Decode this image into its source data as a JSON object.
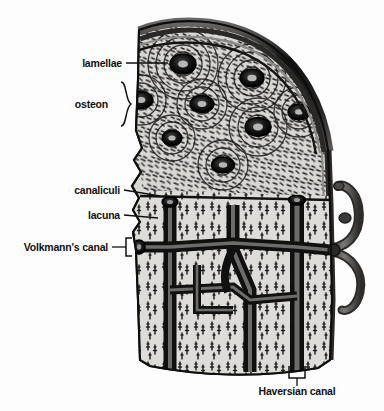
{
  "figure": {
    "background_color": "#fdfdfd",
    "ink_color": "#111111",
    "bone_fill_color": "#d8d6d2",
    "canal_color": "#1a1a1a",
    "vessel_color": "#5a5856",
    "width": 384,
    "height": 411
  },
  "labels": [
    {
      "id": "lamellae",
      "text": "lamellae",
      "align": "right",
      "text_left": 30,
      "text_top": 58,
      "text_width": 92,
      "connector": "line"
    },
    {
      "id": "osteon",
      "text": "osteon",
      "align": "right",
      "text_left": 28,
      "text_top": 102,
      "text_width": 80,
      "connector": "brace"
    },
    {
      "id": "canaliculi",
      "text": "canaliculi",
      "align": "right",
      "text_left": 22,
      "text_top": 185,
      "text_width": 98,
      "connector": "line"
    },
    {
      "id": "lacuna",
      "text": "lacuna",
      "align": "right",
      "text_left": 30,
      "text_top": 210,
      "text_width": 90,
      "connector": "line"
    },
    {
      "id": "volkmanns-canal",
      "text": "Volkmann's canal",
      "align": "right",
      "text_left": 10,
      "text_top": 243,
      "text_width": 110,
      "connector": "square-bracket"
    },
    {
      "id": "haversian-canal",
      "text": "Haversian canal",
      "align": "center",
      "text_left": 233,
      "text_top": 386,
      "text_width": 110,
      "connector": "square-bracket-up"
    }
  ],
  "structures": [
    {
      "id": "periosteum",
      "name": "periosteum outer bands"
    },
    {
      "id": "osteon-field",
      "name": "concentric osteons with Haversian canals"
    },
    {
      "id": "canal-network",
      "name": "Haversian and Volkmann canal network"
    },
    {
      "id": "blood-vessel",
      "name": "nutrient blood vessel"
    },
    {
      "id": "canaliculi-field",
      "name": "canaliculi striations"
    }
  ]
}
